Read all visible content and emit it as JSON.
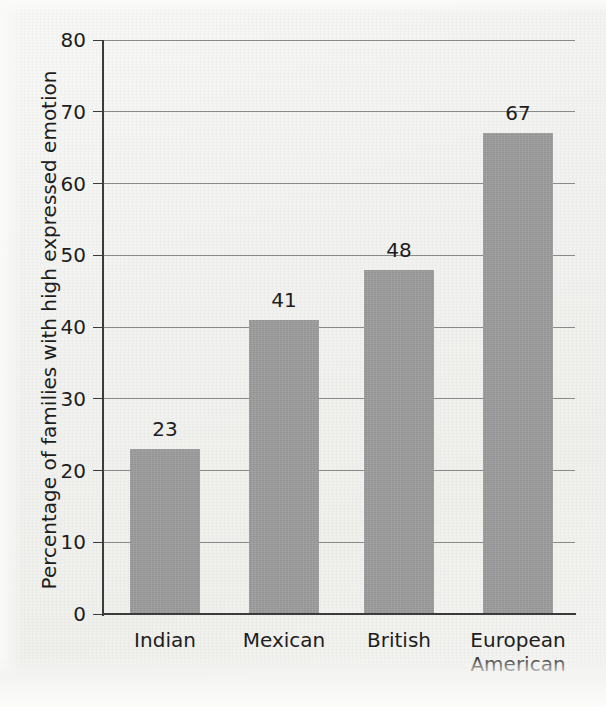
{
  "chart_data": {
    "type": "bar",
    "title": "",
    "subtitle": "",
    "xlabel": "",
    "ylabel": "Percentage of families with high expressed emotion",
    "categories": [
      "Indian",
      "Mexican",
      "British",
      "European American"
    ],
    "category_lines": [
      [
        "Indian"
      ],
      [
        "Mexican"
      ],
      [
        "British"
      ],
      [
        "European",
        "American"
      ]
    ],
    "values": [
      23,
      41,
      48,
      67
    ],
    "value_labels": [
      "23",
      "41",
      "48",
      "67"
    ],
    "ylim": [
      0,
      80
    ],
    "ytick_labels": [
      "0",
      "10",
      "20",
      "30",
      "40",
      "50",
      "60",
      "70",
      "80"
    ],
    "ytick_values": [
      0,
      10,
      20,
      30,
      40,
      50,
      60,
      70,
      80
    ],
    "grid": "horizontal",
    "legend": "none",
    "bar_color": "#9c9c9c",
    "axis_color": "#3b3b3b",
    "gridline_color": "#8a8a8a",
    "text_color": "#1d1d1d",
    "background_color": "#f3f3f1"
  }
}
